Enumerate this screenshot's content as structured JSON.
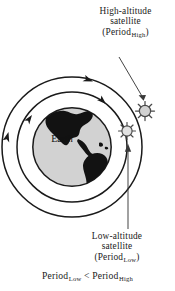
{
  "diagram": {
    "type": "orbital-diagram",
    "central_body": {
      "name": "Earth",
      "label": "Earth",
      "fill_color": "#d2d2d2",
      "outline_color": "#1a1a1a",
      "continent_color": "#121212",
      "center": [
        72,
        147
      ],
      "radius": 40
    },
    "orbits": [
      {
        "id": "inner-orbit",
        "name": "low-altitude-orbit",
        "radius": 55,
        "stroke_color": "#1a1a1a",
        "direction": "counterclockwise"
      },
      {
        "id": "outer-orbit",
        "name": "high-altitude-orbit",
        "radius": 70,
        "stroke_color": "#1a1a1a",
        "direction": "counterclockwise"
      }
    ],
    "satellites": [
      {
        "id": "high-altitude-satellite",
        "orbit": "outer-orbit",
        "position": [
          145,
          111
        ],
        "fill_color": "#d2d2d2",
        "outline_color": "#4a4a4a",
        "spokes": 8
      },
      {
        "id": "low-altitude-satellite",
        "orbit": "inner-orbit",
        "position": [
          127,
          131
        ],
        "fill_color": "#e2e2e2",
        "outline_color": "#4a4a4a",
        "spokes": 8
      }
    ]
  },
  "labels": {
    "high_altitude": {
      "line1": "High-altitude",
      "line2": "satellite",
      "line3_prefix": "(Period",
      "line3_sub": "High",
      "line3_suffix": ")"
    },
    "low_altitude": {
      "line1": "Low-altitude",
      "line2": "satellite",
      "line3_prefix": "(Period",
      "line3_sub": "Low",
      "line3_suffix": ")"
    },
    "earth": "Earth"
  },
  "caption": {
    "term1": "Period",
    "sub1": "Low",
    "operator": "<",
    "term2": "Period",
    "sub2": "High"
  },
  "colors": {
    "ink": "#1a1a1a",
    "earth_fill": "#d2d2d2",
    "satellite_fill": "#d8d8d8",
    "background": "#ffffff"
  }
}
